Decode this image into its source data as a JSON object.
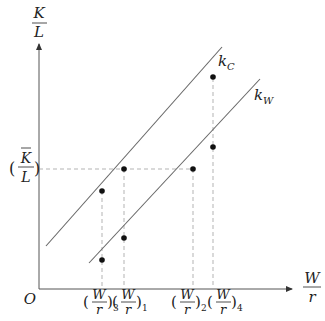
{
  "diagram": {
    "y_axis": {
      "label_num": "K",
      "label_den": "L"
    },
    "x_axis": {
      "label_num": "W",
      "label_den": "r"
    },
    "origin_label": "O",
    "y_marker": {
      "num": "K",
      "den": "L",
      "open": "(",
      "close": ")",
      "overbar": true
    },
    "curves": [
      {
        "name": "k",
        "subscript": "C"
      },
      {
        "name": "k",
        "subscript": "W"
      }
    ],
    "x_ticks": [
      {
        "num": "W",
        "den": "r",
        "open": "(",
        "close": ")",
        "subscript": "3"
      },
      {
        "num": "W",
        "den": "r",
        "open": "(",
        "close": ")",
        "subscript": "1"
      },
      {
        "num": "W",
        "den": "r",
        "open": "(",
        "close": ")",
        "subscript": "2"
      },
      {
        "num": "W",
        "den": "r",
        "open": "(",
        "close": ")",
        "subscript": "4"
      }
    ],
    "colors": {
      "axis": "#555555",
      "line": "#666666",
      "dash": "#aaaaaa",
      "point": "#111111"
    }
  }
}
